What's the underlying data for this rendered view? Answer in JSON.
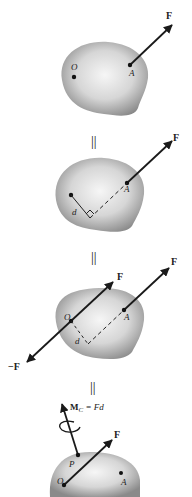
{
  "panels": [
    {
      "id": "panel-1",
      "labels": {
        "force": "F",
        "point_o": "O",
        "point_a": "A"
      }
    },
    {
      "id": "panel-2",
      "labels": {
        "force": "F",
        "point_a": "A",
        "distance": "d"
      }
    },
    {
      "id": "panel-3",
      "labels": {
        "force_a": "F",
        "force_o": "F",
        "neg_force": "−F",
        "point_o": "O",
        "point_a": "A",
        "distance": "d"
      }
    },
    {
      "id": "panel-4",
      "labels": {
        "moment_prefix": "M",
        "moment_sub": "C",
        "moment_rhs": " = Fd",
        "force": "F",
        "point_p": "P",
        "point_o": "O",
        "point_a": "A"
      }
    }
  ],
  "equals_signs": [
    "||",
    "||",
    "||"
  ],
  "colors": {
    "body_light": "#f4f4f4",
    "body_dark": "#8c8c8c",
    "ink": "#1a1a1a"
  }
}
